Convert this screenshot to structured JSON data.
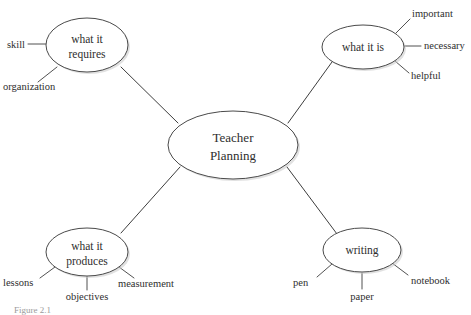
{
  "diagram": {
    "type": "mind-map",
    "background_color": "#ffffff",
    "node_stroke_color": "#4a4a4a",
    "text_color": "#2e2e2e",
    "center": {
      "label_line_1": "Teacher",
      "label_line_2": "Planning"
    },
    "branches": [
      {
        "id": "what-it-requires",
        "label_line_1": "what it",
        "label_line_2": "requires",
        "leaves": [
          {
            "id": "skill",
            "label": "skill"
          },
          {
            "id": "organization",
            "label": "organization"
          }
        ]
      },
      {
        "id": "what-it-is",
        "label_line_1": "what it is",
        "label_line_2": "",
        "leaves": [
          {
            "id": "important",
            "label": "important"
          },
          {
            "id": "necessary",
            "label": "necessary"
          },
          {
            "id": "helpful",
            "label": "helpful"
          }
        ]
      },
      {
        "id": "what-it-produces",
        "label_line_1": "what it",
        "label_line_2": "produces",
        "leaves": [
          {
            "id": "lessons",
            "label": "lessons"
          },
          {
            "id": "objectives",
            "label": "objectives"
          },
          {
            "id": "measurement",
            "label": "measurement"
          }
        ]
      },
      {
        "id": "writing",
        "label_line_1": "writing",
        "label_line_2": "",
        "leaves": [
          {
            "id": "pen",
            "label": "pen"
          },
          {
            "id": "paper",
            "label": "paper"
          },
          {
            "id": "notebook",
            "label": "notebook"
          }
        ]
      }
    ],
    "caption": "Figure 2.1"
  }
}
